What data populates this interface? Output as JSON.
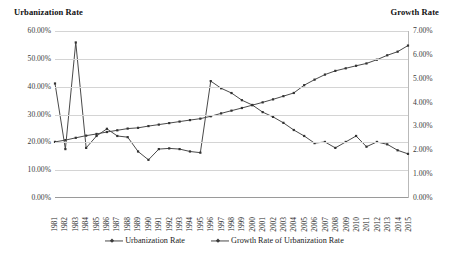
{
  "axis_titles": {
    "left": "Urbanization Rate",
    "right": "Growth Rate"
  },
  "legend": {
    "items": [
      {
        "label": "Urbanization Rate"
      },
      {
        "label": "Growth Rate of Urbanization Rate"
      }
    ]
  },
  "left_axis": {
    "ticks": [
      "60.00%",
      "50.00%",
      "40.00%",
      "30.00%",
      "20.00%",
      "10.00%",
      "0.00%"
    ]
  },
  "right_axis": {
    "ticks": [
      "7.00%",
      "6.00%",
      "5.00%",
      "4.00%",
      "3.00%",
      "2.00%",
      "1.00%",
      "0.00%"
    ]
  },
  "colors": {
    "line": "#4a4a4a",
    "marker": "#333333",
    "grid": "#d4d4d4",
    "axis": "#9a9a9a",
    "text": "#1a1a1a"
  },
  "chart_data": {
    "type": "line",
    "title": "",
    "subtitle": "",
    "xlabel": "",
    "ylabel": "Urbanization Rate",
    "y2label": "Growth Rate",
    "grid": true,
    "legend_position": "bottom",
    "x": [
      1981,
      1982,
      1983,
      1984,
      1985,
      1986,
      1987,
      1988,
      1989,
      1990,
      1991,
      1992,
      1993,
      1994,
      1995,
      1996,
      1997,
      1998,
      1999,
      2000,
      2001,
      2002,
      2003,
      2004,
      2005,
      2006,
      2007,
      2008,
      2009,
      2010,
      2011,
      2012,
      2013,
      2014,
      2015
    ],
    "tick_labels": [
      "1981",
      "1982",
      "1983",
      "1984",
      "1985",
      "1986",
      "1987",
      "1988",
      "1989",
      "1990",
      "1991",
      "1992",
      "1993",
      "1994",
      "1995",
      "1996",
      "1997",
      "1998",
      "1999",
      "2000",
      "2001",
      "2002",
      "2003",
      "2004",
      "2005",
      "2006",
      "2007",
      "2008",
      "2009",
      "2010",
      "2011",
      "2012",
      "2013",
      "2014",
      "2015"
    ],
    "ylim": [
      0,
      60
    ],
    "y2lim": [
      0,
      7
    ],
    "series": [
      {
        "name": "Urbanization Rate",
        "axis": "left",
        "unit": "%",
        "values": [
          20.16,
          20.8,
          21.62,
          22.4,
          23.01,
          23.71,
          24.32,
          24.94,
          25.21,
          25.84,
          26.37,
          26.91,
          27.46,
          27.99,
          28.51,
          29.37,
          30.4,
          31.38,
          32.33,
          33.35,
          34.36,
          35.44,
          36.59,
          37.74,
          40.53,
          42.52,
          44.34,
          45.68,
          46.59,
          47.5,
          48.34,
          49.68,
          51.27,
          52.57,
          54.77
        ]
      },
      {
        "name": "Growth Rate of Urbanization Rate",
        "axis": "right",
        "unit": "%",
        "values": [
          4.8,
          2.05,
          6.52,
          2.1,
          2.6,
          2.9,
          2.6,
          2.55,
          1.95,
          1.6,
          2.05,
          2.08,
          2.05,
          1.95,
          1.9,
          4.9,
          4.6,
          4.4,
          4.1,
          3.9,
          3.6,
          3.4,
          3.15,
          2.85,
          2.6,
          2.3,
          2.35,
          2.1,
          2.35,
          2.6,
          2.15,
          2.35,
          2.25,
          2.0,
          1.85
        ]
      }
    ]
  }
}
